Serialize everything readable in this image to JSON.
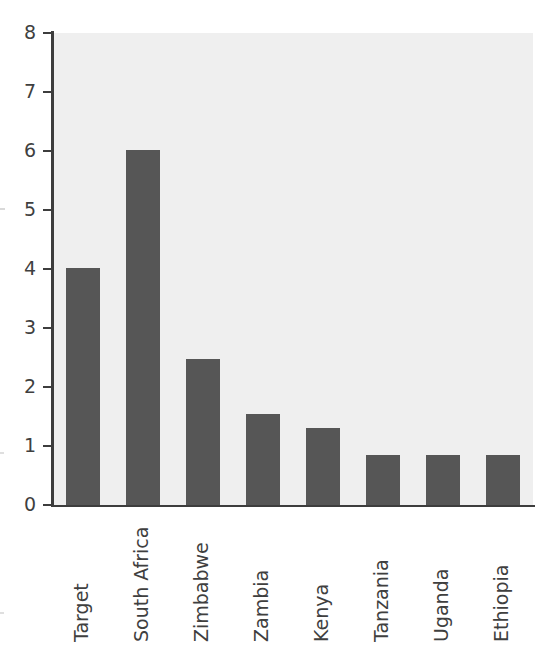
{
  "chart_data": {
    "type": "bar",
    "title": "",
    "subtitle": "",
    "xlabel": "",
    "ylabel": "",
    "categories": [
      "Target",
      "South Africa",
      "Zimbabwe",
      "Zambia",
      "Kenya",
      "Tanzania",
      "Uganda",
      "Ethiopia"
    ],
    "values": [
      4.02,
      6.02,
      2.47,
      1.54,
      1.3,
      0.85,
      0.85,
      0.85
    ],
    "ylim": [
      0,
      8
    ],
    "xlim": null,
    "y_ticks": [
      0,
      1,
      2,
      3,
      4,
      5,
      6,
      7,
      8
    ],
    "y_tick_labels": [
      "0",
      "1",
      "2",
      "3",
      "4",
      "5",
      "6",
      "7",
      "8"
    ],
    "grid": false,
    "legend": null,
    "legend_position": "none",
    "annotations": [],
    "orientation": "vertical",
    "x_tick_label_rotation": 90
  },
  "style": {
    "bar_color": "#565656",
    "plot_background": "#efefef",
    "page_background": "#ffffff",
    "axis_color": "#3d3d3d",
    "tick_label_color": "#3f3f3f"
  }
}
